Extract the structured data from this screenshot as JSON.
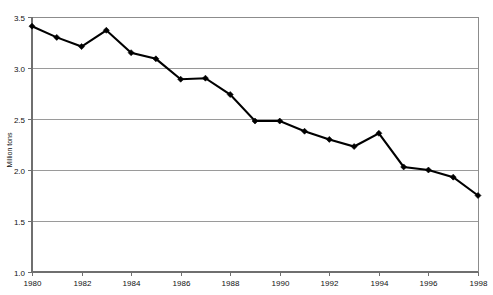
{
  "chart_data": {
    "type": "line",
    "title": "",
    "xlabel": "",
    "ylabel": "Million tons",
    "x": [
      1980,
      1981,
      1982,
      1983,
      1984,
      1985,
      1986,
      1987,
      1988,
      1989,
      1990,
      1991,
      1992,
      1993,
      1994,
      1995,
      1996,
      1997,
      1998
    ],
    "values": [
      3.41,
      3.3,
      3.21,
      3.37,
      3.15,
      3.09,
      2.89,
      2.9,
      2.74,
      2.48,
      2.48,
      2.38,
      2.3,
      2.23,
      2.36,
      2.03,
      2.0,
      1.93,
      1.75
    ],
    "series": [
      {
        "name": "Million tons",
        "values": [
          3.41,
          3.3,
          3.21,
          3.37,
          3.15,
          3.09,
          2.89,
          2.9,
          2.74,
          2.48,
          2.48,
          2.38,
          2.3,
          2.23,
          2.36,
          2.03,
          2.0,
          1.93,
          1.75
        ]
      }
    ],
    "xlim": [
      1980,
      1998
    ],
    "ylim": [
      1.0,
      3.5
    ],
    "y_ticks": [
      1.0,
      1.5,
      2.0,
      2.5,
      3.0,
      3.5
    ],
    "y_tick_labels": [
      "1.0",
      "1.5",
      "2.0",
      "2.5",
      "3.0",
      "3.5"
    ],
    "x_ticks": [
      1980,
      1982,
      1984,
      1986,
      1988,
      1990,
      1992,
      1994,
      1996,
      1998
    ],
    "x_tick_labels": [
      "1980",
      "1982",
      "1984",
      "1986",
      "1988",
      "1990",
      "1992",
      "1994",
      "1996",
      "1998"
    ],
    "grid": true,
    "grid_axis": "y",
    "legend": false,
    "legend_position": "none",
    "markers": true,
    "marker_shape": "diamond",
    "line_color": "#000000",
    "marker_color": "#000000",
    "grid_color": "#9a9a9a",
    "background_color": "#ffffff",
    "annotations": []
  },
  "axis": {
    "y_title": "Million tons"
  }
}
